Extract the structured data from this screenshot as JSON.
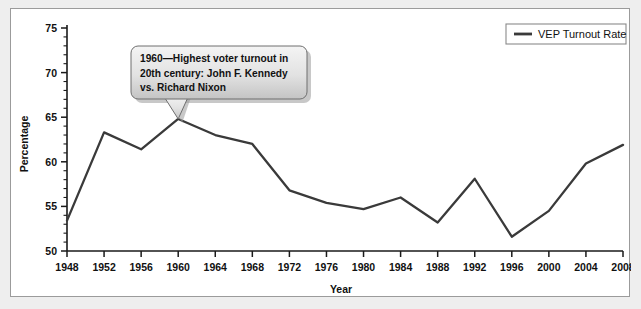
{
  "chart_data": {
    "type": "line",
    "title": "",
    "xlabel": "Year",
    "ylabel": "Percentage",
    "x": [
      1948,
      1952,
      1956,
      1960,
      1964,
      1968,
      1972,
      1976,
      1980,
      1984,
      1988,
      1992,
      1996,
      2000,
      2004,
      2008
    ],
    "categories": [
      "1948",
      "1952",
      "1956",
      "1960",
      "1964",
      "1968",
      "1972",
      "1976",
      "1980",
      "1984",
      "1988",
      "1992",
      "1996",
      "2000",
      "2004",
      "2008"
    ],
    "series": [
      {
        "name": "VEP Turnout Rate",
        "color": "#3a3a3a",
        "values": [
          53.4,
          63.3,
          61.4,
          64.8,
          63.0,
          62.0,
          56.8,
          55.4,
          54.7,
          56.0,
          53.2,
          58.1,
          51.6,
          54.5,
          59.8,
          61.9
        ]
      }
    ],
    "xlim": [
      1948,
      2008
    ],
    "ylim": [
      50,
      75
    ],
    "ytick_values": [
      50,
      55,
      60,
      65,
      70,
      75
    ],
    "ytick_labels": [
      "50",
      "55",
      "60",
      "65",
      "70",
      "75"
    ],
    "yminor_step": 1,
    "grid": false,
    "legend_position": "top-right",
    "annotations": [
      {
        "name": "peak-1960-callout",
        "text_lines": [
          "1960—Highest voter turnout in",
          "20th century: John F. Kennedy",
          "vs. Richard Nixon"
        ],
        "anchor_x": 1960,
        "anchor_y": 64.8
      }
    ]
  },
  "legend": {
    "entries": [
      {
        "label": "VEP Turnout Rate"
      }
    ]
  },
  "colors": {
    "page_background": "#eeeeee",
    "panel_background": "#ffffff",
    "panel_border": "#9b9b9b",
    "series": "#3a3a3a",
    "axis": "#1a1a1a",
    "callout_fill_top": "#f2f2f2",
    "callout_fill_bottom": "#c9c9c9",
    "callout_border": "#6f6f6f"
  }
}
